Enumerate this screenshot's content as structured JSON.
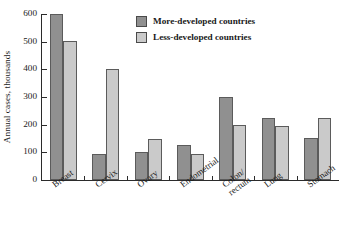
{
  "chart_data": {
    "type": "bar",
    "title": "",
    "subtitle": "",
    "xlabel": "",
    "ylabel": "Annual cases, thousands",
    "ylim": [
      0,
      600
    ],
    "yticks": [
      0,
      100,
      200,
      300,
      400,
      500,
      600
    ],
    "ytick_labels": [
      "0",
      "100",
      "200",
      "300",
      "400",
      "500",
      "600"
    ],
    "grid": false,
    "legend_position": "top-center",
    "categories": [
      "Breast",
      "Cervix",
      "Ovary",
      "Endometrial",
      "Colon/rectum",
      "Lung",
      "Stomach"
    ],
    "category_lines": [
      [
        "Breast"
      ],
      [
        "Cervix"
      ],
      [
        "Ovary"
      ],
      [
        "Endometrial"
      ],
      [
        "Colon/",
        "rectum"
      ],
      [
        "Lung"
      ],
      [
        "Stomach"
      ]
    ],
    "series": [
      {
        "name": "More-developed countries",
        "color": "#909090",
        "values": [
          600,
          95,
          102,
          128,
          300,
          225,
          152
        ]
      },
      {
        "name": "Less-developed countries",
        "color": "#cacaca",
        "values": [
          503,
          400,
          150,
          95,
          200,
          195,
          225
        ]
      }
    ]
  },
  "legend": {
    "items": [
      {
        "label": "More-developed countries",
        "key": "more"
      },
      {
        "label": "Less-developed countries",
        "key": "less"
      }
    ]
  },
  "colors": {
    "more_developed": "#909090",
    "less_developed": "#cacaca",
    "axis": "#2b2b2b",
    "bar_border": "#5b5b5b",
    "background": "#ffffff"
  }
}
